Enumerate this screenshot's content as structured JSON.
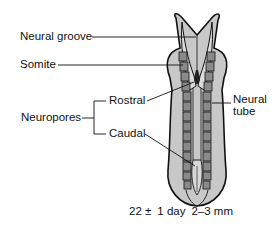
{
  "figure": {
    "type": "embryo-dorsal-view",
    "labels": {
      "neural_groove": "Neural groove",
      "somite": "Somite",
      "neuropores": "Neuropores",
      "rostral": "Rostral",
      "caudal": "Caudal",
      "neural_tube_line1": "Neural",
      "neural_tube_line2": "tube"
    },
    "caption": {
      "age": "22 ±",
      "age_unit": "1 day",
      "size": "2–3 mm"
    },
    "colors": {
      "embryo_fill": "#c8c8c8",
      "embryo_light": "#d9d9d9",
      "somite_fill": "#8a8a8a",
      "outline": "#111111",
      "background": "#ffffff"
    }
  }
}
